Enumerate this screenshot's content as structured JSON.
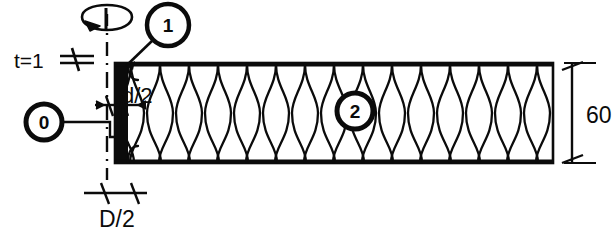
{
  "drawing": {
    "title": "Coil winding cross-section",
    "line_color": "#0b0b0b",
    "fill_color": "#ffffff",
    "background": "#ffffff"
  },
  "balloons": [
    {
      "id": "0",
      "label": "0",
      "cx": 44,
      "cy": 122,
      "r": 18
    },
    {
      "id": "1",
      "label": "1",
      "cx": 168,
      "cy": 25,
      "r": 21
    },
    {
      "id": "2",
      "label": "2",
      "cx": 355,
      "cy": 111,
      "r": 18
    }
  ],
  "dimensions": {
    "thickness": {
      "label": "t=1",
      "x": 14,
      "y": 50
    },
    "wire_radius": {
      "label": "d/2",
      "x": 122,
      "y": 85
    },
    "mandrel_radius": {
      "label": "D/2",
      "x": 99,
      "y": 208
    },
    "height": {
      "label": "60",
      "x": 586,
      "y": 104
    }
  },
  "geometry": {
    "body_left": 115,
    "body_right": 553,
    "body_top": 63,
    "body_bottom": 163,
    "wall_thickness": 13,
    "centerline_x": 107,
    "coil_count": 15
  },
  "icons": {
    "rotation": "rotation-arrow-icon",
    "centerline": "centerline-axis-icon"
  }
}
